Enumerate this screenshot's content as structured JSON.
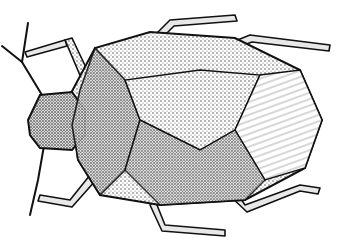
{
  "image": {
    "subject": "shield bug illustration",
    "style": "black-and-white stipple drawing",
    "colors": {
      "background": "#ffffff",
      "ink": "#111111",
      "stipple_light": "#9a9a9a",
      "stipple_mid": "#6a6a6a",
      "stipple_dark": "#3a3a3a"
    }
  }
}
